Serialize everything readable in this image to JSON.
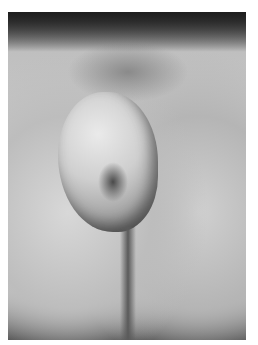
{
  "image": {
    "kind": "grayscale clinical photograph",
    "colors": {
      "frame_border": "#ffffff",
      "dark_edges": "#2a2a2a",
      "skin_mid": "#c8c8c8",
      "lesion_highlight": "#eaeaea",
      "lesion_shadow": "#6a6a6a"
    }
  }
}
